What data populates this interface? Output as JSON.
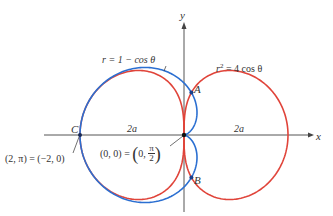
{
  "chart_data": {
    "type": "polar-curves",
    "title": "",
    "axes": {
      "x_label": "x",
      "y_label": "y",
      "origin_px": [
        184,
        135
      ],
      "unit_px": 52
    },
    "curves": [
      {
        "name": "cardioid",
        "equation_text": "r = 1 − cos θ",
        "color": "#2b6fd1",
        "formula": "r = 1 - cos(theta)"
      },
      {
        "name": "lemniscate",
        "equation_text": "r² = 4 cos θ",
        "color": "#e0443a",
        "formula": "r^2 = 4 cos(theta)"
      }
    ],
    "points": [
      {
        "label": "A",
        "description": "intersection (upper)"
      },
      {
        "label": "B",
        "description": "intersection (lower)"
      },
      {
        "label": "C",
        "description": "(2, π) = (−2, 0)"
      },
      {
        "label": "O",
        "description": "(0, 0) = (0, π/2)"
      }
    ],
    "annotations": [
      "2a",
      "2a"
    ]
  },
  "labels": {
    "y_axis": "y",
    "x_axis": "x",
    "cardioid_eq": "r = 1 − cos θ",
    "lemniscate_r": "r",
    "lemniscate_sup": "2",
    "lemniscate_rest": " = 4 cos θ",
    "point_a": "A",
    "point_b": "B",
    "point_c": "C",
    "left_2a": "2a",
    "right_2a": "2a",
    "c_coords": "(2, π) = (−2, 0)",
    "origin_lhs": "(0, 0) = ",
    "origin_open": "(",
    "origin_zero": "0, ",
    "origin_num": "π",
    "origin_den": "2",
    "origin_close": ")"
  }
}
